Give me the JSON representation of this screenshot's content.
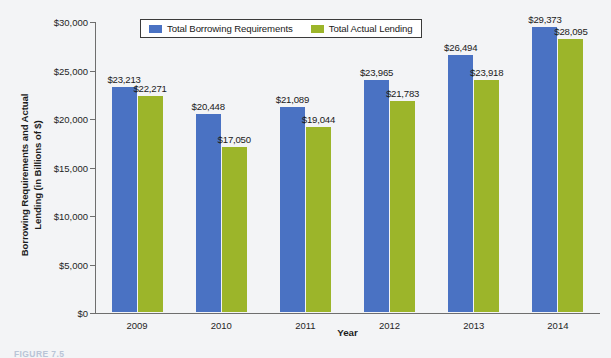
{
  "chart_data": {
    "type": "bar",
    "title": "",
    "xlabel": "Year",
    "ylabel": "Borrowing Requirements and Actual Lending (in Billions of $)",
    "ylabel_line1": "Borrowing Requirements and Actual",
    "ylabel_line2": "Lending (in Billions of $)",
    "categories": [
      "2009",
      "2010",
      "2011",
      "2012",
      "2013",
      "2014"
    ],
    "ylim": [
      0,
      30000
    ],
    "ytick_values": [
      0,
      5000,
      10000,
      15000,
      20000,
      25000,
      30000
    ],
    "ytick_labels": [
      "$0",
      "$5,000",
      "$10,000",
      "$15,000",
      "$20,000",
      "$25,000",
      "$30,000"
    ],
    "grid": false,
    "legend_position": "top-center",
    "series": [
      {
        "name": "Total Borrowing Requirements",
        "color": "#4a72c3",
        "values": [
          23213,
          20448,
          21089,
          23965,
          26494,
          29373
        ],
        "labels": [
          "$23,213",
          "$20,448",
          "$21,089",
          "$23,965",
          "$26,494",
          "$29,373"
        ]
      },
      {
        "name": "Total Actual Lending",
        "color": "#9cb52a",
        "values": [
          22271,
          17050,
          19044,
          21783,
          23918,
          28095
        ],
        "labels": [
          "$22,271",
          "$17,050",
          "$19,044",
          "$21,783",
          "$23,918",
          "$28,095"
        ]
      }
    ]
  },
  "caption": "FIGURE 7.5"
}
